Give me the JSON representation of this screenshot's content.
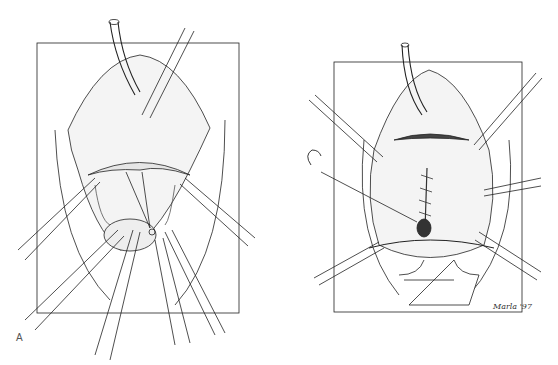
{
  "figure": {
    "top_text_fragment": "",
    "panels": [
      {
        "id": "A",
        "label": "A",
        "description": "Surgical field with retractors, catheter and scissors"
      },
      {
        "id": "B",
        "label": "B",
        "description": "Surgical field with retractors, catheter, suture line and curved needle"
      }
    ],
    "signature": "Marla '97"
  },
  "colors": {
    "ink": "#222222",
    "paper": "#ffffff",
    "stipple": "#888888"
  }
}
